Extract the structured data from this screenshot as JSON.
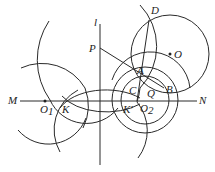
{
  "figure": {
    "width": 215,
    "height": 172,
    "stroke_color": "#2a2a2a",
    "labels": {
      "l": "l",
      "P": "P",
      "D": "D",
      "O": "O",
      "A": "A",
      "C": "C",
      "Q": "Q",
      "B": "B",
      "M": "M",
      "N": "N",
      "O1": "O",
      "O1_sub": "1",
      "K": "K",
      "K_prime": "K′",
      "O2": "O",
      "O2_sub": "2"
    },
    "points": {
      "P": [
        100,
        48
      ],
      "D": [
        149,
        20
      ],
      "O": [
        170,
        54
      ],
      "A": [
        142,
        70
      ],
      "C": [
        136,
        88
      ],
      "Q": [
        146,
        92
      ],
      "B": [
        163,
        86
      ],
      "O1": [
        45,
        101
      ],
      "K": [
        68,
        101
      ],
      "K_prime": [
        133,
        101
      ],
      "O2": [
        145,
        101
      ]
    },
    "lines": {
      "MN": [
        [
          20,
          101
        ],
        [
          197,
          101
        ]
      ],
      "l": [
        [
          100,
          24
        ],
        [
          100,
          165
        ]
      ],
      "PB": [
        [
          100,
          48
        ],
        [
          163,
          87
        ]
      ],
      "DK": [
        [
          149,
          20
        ],
        [
          137,
          102
        ]
      ]
    },
    "circles": {
      "circle_O": {
        "cx": 170,
        "cy": 54,
        "r": 39
      },
      "circle_O2_inner": {
        "cx": 145,
        "cy": 100,
        "r": 24
      },
      "circle_O2_outer": {
        "cx": 145,
        "cy": 100,
        "r": 33
      }
    }
  }
}
